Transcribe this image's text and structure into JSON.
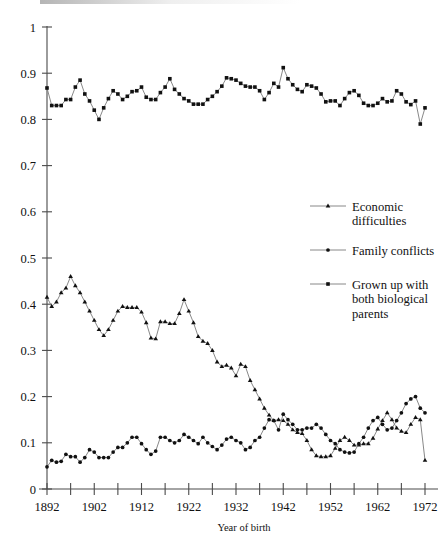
{
  "chart_data": {
    "type": "line",
    "title": "",
    "xlabel": "Year of birth",
    "ylabel": "",
    "xlim": [
      1892,
      1972
    ],
    "ylim": [
      0,
      1
    ],
    "grid": false,
    "legend_position": "right-middle",
    "x_tick_labels": [
      "1892",
      "1902",
      "1912",
      "1922",
      "1932",
      "1942",
      "1952",
      "1962",
      "1972"
    ],
    "x_tick_values": [
      1892,
      1902,
      1912,
      1922,
      1932,
      1942,
      1952,
      1962,
      1972
    ],
    "x_minor_tick_step": 5,
    "y_tick_labels": [
      "0",
      "0.1",
      "0.2",
      "0.3",
      "0.4",
      "0.5",
      "0.6",
      "0.7",
      "0.8",
      "0.9",
      "1"
    ],
    "y_tick_values": [
      0,
      0.1,
      0.2,
      0.3,
      0.4,
      0.5,
      0.6,
      0.7,
      0.8,
      0.9,
      1
    ],
    "x": [
      1892,
      1893,
      1894,
      1895,
      1896,
      1897,
      1898,
      1899,
      1900,
      1901,
      1902,
      1903,
      1904,
      1905,
      1906,
      1907,
      1908,
      1909,
      1910,
      1911,
      1912,
      1913,
      1914,
      1915,
      1916,
      1917,
      1918,
      1919,
      1920,
      1921,
      1922,
      1923,
      1924,
      1925,
      1926,
      1927,
      1928,
      1929,
      1930,
      1931,
      1932,
      1933,
      1934,
      1935,
      1936,
      1937,
      1938,
      1939,
      1940,
      1941,
      1942,
      1943,
      1944,
      1945,
      1946,
      1947,
      1948,
      1949,
      1950,
      1951,
      1952,
      1953,
      1954,
      1955,
      1956,
      1957,
      1958,
      1959,
      1960,
      1961,
      1962,
      1963,
      1964,
      1965,
      1966,
      1967,
      1968,
      1969,
      1970,
      1971,
      1972
    ],
    "series": [
      {
        "name": "Economic difficulties",
        "marker": "triangle",
        "values": [
          0.415,
          0.395,
          0.405,
          0.425,
          0.435,
          0.46,
          0.44,
          0.425,
          0.405,
          0.385,
          0.365,
          0.345,
          0.332,
          0.345,
          0.365,
          0.385,
          0.395,
          0.393,
          0.393,
          0.393,
          0.383,
          0.36,
          0.327,
          0.325,
          0.362,
          0.362,
          0.358,
          0.358,
          0.38,
          0.41,
          0.385,
          0.36,
          0.33,
          0.32,
          0.315,
          0.3,
          0.275,
          0.265,
          0.268,
          0.262,
          0.245,
          0.27,
          0.265,
          0.235,
          0.215,
          0.195,
          0.175,
          0.16,
          0.148,
          0.15,
          0.148,
          0.14,
          0.128,
          0.122,
          0.12,
          0.105,
          0.085,
          0.072,
          0.07,
          0.07,
          0.072,
          0.088,
          0.105,
          0.112,
          0.105,
          0.095,
          0.095,
          0.098,
          0.098,
          0.11,
          0.13,
          0.148,
          0.165,
          0.15,
          0.132,
          0.125,
          0.122,
          0.14,
          0.155,
          0.15,
          0.062
        ]
      },
      {
        "name": "Family conflicts",
        "marker": "circle",
        "values": [
          0.048,
          0.062,
          0.058,
          0.06,
          0.075,
          0.07,
          0.07,
          0.058,
          0.068,
          0.085,
          0.08,
          0.068,
          0.068,
          0.068,
          0.08,
          0.09,
          0.09,
          0.1,
          0.112,
          0.112,
          0.098,
          0.085,
          0.075,
          0.082,
          0.112,
          0.112,
          0.105,
          0.1,
          0.105,
          0.118,
          0.112,
          0.105,
          0.098,
          0.112,
          0.1,
          0.092,
          0.085,
          0.095,
          0.108,
          0.112,
          0.105,
          0.1,
          0.085,
          0.09,
          0.105,
          0.112,
          0.132,
          0.15,
          0.148,
          0.128,
          0.162,
          0.15,
          0.14,
          0.128,
          0.128,
          0.132,
          0.132,
          0.14,
          0.132,
          0.118,
          0.105,
          0.098,
          0.085,
          0.08,
          0.078,
          0.08,
          0.098,
          0.112,
          0.132,
          0.148,
          0.155,
          0.14,
          0.128,
          0.132,
          0.148,
          0.165,
          0.185,
          0.195,
          0.2,
          0.175,
          0.165
        ]
      },
      {
        "name": "Grown up with both biological parents",
        "marker": "square",
        "values": [
          0.868,
          0.83,
          0.83,
          0.83,
          0.843,
          0.843,
          0.87,
          0.885,
          0.855,
          0.84,
          0.82,
          0.8,
          0.825,
          0.845,
          0.862,
          0.855,
          0.843,
          0.85,
          0.86,
          0.862,
          0.87,
          0.848,
          0.843,
          0.843,
          0.858,
          0.87,
          0.888,
          0.865,
          0.855,
          0.845,
          0.84,
          0.833,
          0.833,
          0.833,
          0.843,
          0.85,
          0.86,
          0.872,
          0.89,
          0.888,
          0.885,
          0.878,
          0.872,
          0.87,
          0.87,
          0.862,
          0.843,
          0.858,
          0.878,
          0.87,
          0.912,
          0.888,
          0.875,
          0.865,
          0.86,
          0.875,
          0.872,
          0.868,
          0.855,
          0.838,
          0.84,
          0.84,
          0.83,
          0.845,
          0.858,
          0.862,
          0.852,
          0.835,
          0.83,
          0.83,
          0.835,
          0.845,
          0.838,
          0.84,
          0.862,
          0.855,
          0.838,
          0.832,
          0.84,
          0.79,
          0.825
        ]
      }
    ]
  },
  "legend": {
    "items": [
      {
        "label_line1": "Economic",
        "label_line2": "difficulties",
        "label_line3": "",
        "marker": "triangle-marker"
      },
      {
        "label_line1": "Family conflicts",
        "label_line2": "",
        "label_line3": "",
        "marker": "circle-marker"
      },
      {
        "label_line1": "Grown up with",
        "label_line2": "both biological",
        "label_line3": "parents",
        "marker": "square-marker"
      }
    ]
  },
  "colors": {
    "marker": "#111111",
    "line": "#7a7a7a",
    "axis": "#4a4a4a",
    "background": "#ffffff"
  }
}
